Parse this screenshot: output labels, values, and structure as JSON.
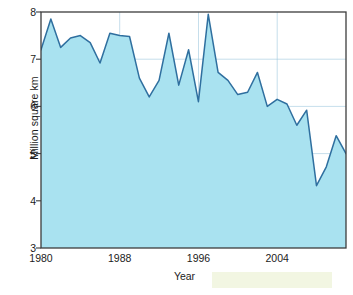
{
  "chart_data": {
    "type": "area",
    "title": "",
    "xlabel": "Year",
    "ylabel": "Million square km",
    "xlim": [
      1980,
      2011
    ],
    "ylim": [
      3,
      8
    ],
    "xticks": [
      1980,
      1988,
      1996,
      2004
    ],
    "yticks": [
      3,
      4,
      5,
      6,
      7,
      8
    ],
    "grid": true,
    "legend": null,
    "series_name": "Arctic sea ice minimum extent",
    "line_color": "#2f6f9f",
    "fill_color": "#a9e2f0",
    "x": [
      1980,
      1981,
      1982,
      1983,
      1984,
      1985,
      1986,
      1987,
      1988,
      1989,
      1990,
      1991,
      1992,
      1993,
      1994,
      1995,
      1996,
      1997,
      1998,
      1999,
      2000,
      2001,
      2002,
      2003,
      2004,
      2005,
      2006,
      2007,
      2008,
      2009,
      2010,
      2011
    ],
    "values": [
      7.2,
      7.85,
      7.25,
      7.45,
      7.5,
      7.35,
      6.92,
      7.55,
      7.5,
      7.48,
      6.6,
      6.2,
      6.55,
      7.55,
      6.45,
      7.2,
      6.1,
      7.95,
      6.72,
      6.55,
      6.25,
      6.3,
      6.72,
      6.0,
      6.15,
      6.05,
      5.6,
      5.92,
      4.32,
      4.72,
      5.38,
      5.0
    ],
    "annotations": []
  },
  "axes": {
    "ylabel": "Million square km",
    "xlabel": "Year",
    "ytick_labels": [
      "8",
      "7",
      "6",
      "5",
      "4",
      "3"
    ],
    "xtick_labels": [
      "1980",
      "1988",
      "1996",
      "2004"
    ]
  },
  "artifacts": {
    "bleed_text": "  paragraphs from\n  the reverse of\n  this printed page\n  showing through\n  the paper stock\n  faintly visible\n  behind the plot\n  area as mirrored\n  lines of body\n  copy bleeding\n  through from\n  the other side"
  }
}
